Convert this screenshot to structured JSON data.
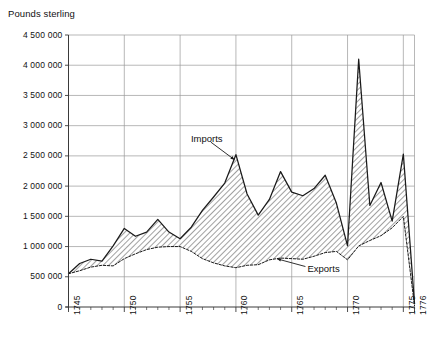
{
  "chart_data": {
    "type": "area",
    "title": "",
    "ylabel": "Pounds sterling",
    "xlabel": "",
    "ylim": [
      0,
      4500000
    ],
    "xlim": [
      1745,
      1776
    ],
    "grid": true,
    "y_ticks": [
      "0",
      "500 000",
      "1 000 000",
      "1 500 000",
      "2 000 000",
      "2 500 000",
      "3 000 000",
      "3 500 000",
      "4 000 000",
      "4 500 000"
    ],
    "y_tick_values": [
      0,
      500000,
      1000000,
      1500000,
      2000000,
      2500000,
      3000000,
      3500000,
      4000000,
      4500000
    ],
    "x_ticks": [
      "1745",
      "1750",
      "1755",
      "1760",
      "1765",
      "1770",
      "1775",
      "1776"
    ],
    "x_tick_values": [
      1745,
      1750,
      1755,
      1760,
      1765,
      1770,
      1775,
      1776
    ],
    "x_minor_step": 1,
    "legend_position": "inline-annotations",
    "annotations": [
      {
        "text": "Imports",
        "x": 1757.4,
        "y": 2760000,
        "arrow_to_x": 1760.0,
        "arrow_to_y": 2520000
      },
      {
        "text": "Exports",
        "x": 1765.6,
        "y": 620000,
        "arrow_to_x": 1763.6,
        "arrow_to_y": 780000
      }
    ],
    "x": [
      1745,
      1746,
      1747,
      1748,
      1749,
      1750,
      1751,
      1752,
      1753,
      1754,
      1755,
      1756,
      1757,
      1758,
      1759,
      1760,
      1761,
      1762,
      1763,
      1764,
      1765,
      1766,
      1767,
      1768,
      1769,
      1770,
      1771,
      1772,
      1773,
      1774,
      1775,
      1776
    ],
    "series": [
      {
        "name": "Imports",
        "values": [
          550000,
          720000,
          790000,
          760000,
          1010000,
          1300000,
          1170000,
          1240000,
          1450000,
          1240000,
          1130000,
          1320000,
          1600000,
          1820000,
          2050000,
          2520000,
          1870000,
          1520000,
          1780000,
          2240000,
          1900000,
          1840000,
          1960000,
          2180000,
          1720000,
          1010000,
          4100000,
          1680000,
          2060000,
          1420000,
          2530000,
          60000
        ]
      },
      {
        "name": "Exports",
        "values": [
          550000,
          600000,
          660000,
          690000,
          680000,
          800000,
          880000,
          950000,
          990000,
          1000000,
          1000000,
          920000,
          800000,
          730000,
          680000,
          650000,
          690000,
          700000,
          780000,
          810000,
          800000,
          790000,
          840000,
          900000,
          920000,
          780000,
          1010000,
          1100000,
          1180000,
          1310000,
          1500000,
          20000
        ]
      }
    ]
  },
  "annotation_labels": {
    "imports": "Imports",
    "exports": "Exports"
  }
}
